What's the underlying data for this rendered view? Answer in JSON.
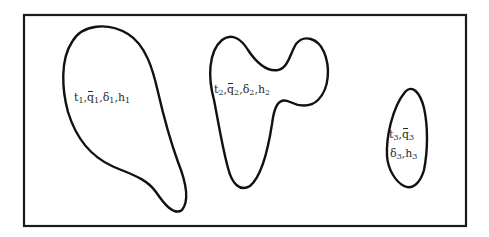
{
  "diagram": {
    "frame": {
      "x": 23,
      "y": 14,
      "width": 444,
      "height": 212
    },
    "regions": [
      {
        "id": 1,
        "label_parts": [
          {
            "sym": "t",
            "sub": "1"
          },
          {
            "sym": "q",
            "sub": "1",
            "bar": true
          },
          {
            "sym": "δ",
            "sub": "1"
          },
          {
            "sym": "h",
            "sub": "1"
          }
        ],
        "label_text": "t1, q̄1, δ1, h1"
      },
      {
        "id": 2,
        "label_parts": [
          {
            "sym": "t",
            "sub": "2"
          },
          {
            "sym": "q",
            "sub": "2",
            "bar": true
          },
          {
            "sym": "δ",
            "sub": "2"
          },
          {
            "sym": "h",
            "sub": "2"
          }
        ],
        "label_text": "t2, q̄2, δ2, h2"
      },
      {
        "id": 3,
        "label_parts": [
          {
            "sym": "t",
            "sub": "3"
          },
          {
            "sym": "q",
            "sub": "3",
            "bar": true
          },
          {
            "sym": "δ",
            "sub": "3"
          },
          {
            "sym": "h",
            "sub": "3"
          }
        ],
        "label_text": "t3, q̄3, δ3, h3"
      }
    ],
    "colors": {
      "stroke": "#111111",
      "background": "#ffffff",
      "text": "#2a2a2a"
    }
  },
  "text": {
    "r1": {
      "t": "t",
      "t_sub": "1",
      "q": "q",
      "q_sub": "1",
      "d": "δ",
      "d_sub": "1",
      "h": "h",
      "h_sub": "1",
      "sep": ","
    },
    "r2": {
      "t": "t",
      "t_sub": "2",
      "q": "q",
      "q_sub": "2",
      "d": "δ",
      "d_sub": "2",
      "h": "h",
      "h_sub": "2",
      "sep": ","
    },
    "r3": {
      "t": "t",
      "t_sub": "3",
      "q": "q",
      "q_sub": "3",
      "d": "δ",
      "d_sub": "3",
      "h": "h",
      "h_sub": "3",
      "sep": ","
    }
  }
}
